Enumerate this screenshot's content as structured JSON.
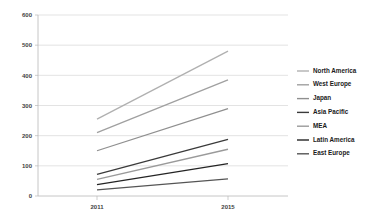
{
  "chart_data": {
    "type": "line",
    "title": "",
    "subtitle": "",
    "xlabel": "",
    "ylabel": "",
    "x": [
      "2011",
      "2015"
    ],
    "categories": [
      "2011",
      "2015"
    ],
    "xtick_labels": [
      "2011",
      "2015"
    ],
    "ytick_labels": [
      "0",
      "100",
      "200",
      "300",
      "400",
      "500",
      "600"
    ],
    "yticks": [
      0,
      100,
      200,
      300,
      400,
      500,
      600
    ],
    "ylim": [
      0,
      600
    ],
    "grid": "horizontal",
    "legend_position": "right",
    "series": [
      {
        "name": "North America",
        "values": [
          255,
          480
        ],
        "color": "#b0b0b0"
      },
      {
        "name": "West Europe",
        "values": [
          210,
          385
        ],
        "color": "#a0a0a0"
      },
      {
        "name": "Japan",
        "values": [
          150,
          290
        ],
        "color": "#8f8f8f"
      },
      {
        "name": "Asia Pacific",
        "values": [
          72,
          188
        ],
        "color": "#3a3a3a"
      },
      {
        "name": "MEA",
        "values": [
          55,
          155
        ],
        "color": "#9a9a9a"
      },
      {
        "name": "Latin America",
        "values": [
          38,
          107
        ],
        "color": "#242424"
      },
      {
        "name": "East Europe",
        "values": [
          20,
          57
        ],
        "color": "#555555"
      }
    ]
  },
  "legend": {
    "items": [
      {
        "label": "North America"
      },
      {
        "label": "West Europe"
      },
      {
        "label": "Japan"
      },
      {
        "label": "Asia Pacific"
      },
      {
        "label": "MEA"
      },
      {
        "label": "Latin America"
      },
      {
        "label": "East Europe"
      }
    ]
  },
  "axes": {
    "y": {
      "ticks": [
        "600",
        "500",
        "400",
        "300",
        "200",
        "100",
        "0"
      ]
    },
    "x": {
      "ticks": [
        "2011",
        "2015"
      ]
    }
  }
}
